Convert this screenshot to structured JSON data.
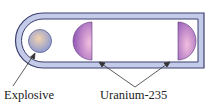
{
  "diagram": {
    "type": "gun-type fission device",
    "labels": {
      "explosive": "Explosive",
      "uranium": "Uranium-235"
    },
    "colors": {
      "tube_fill": "#c3cbe8",
      "tube_stroke": "#3b3f6e",
      "explosive_light": "#f1d2b0",
      "explosive_dark": "#8e9bd0",
      "uranium_light": "#f0b8dc",
      "uranium_dark": "#8a4fb0"
    }
  }
}
